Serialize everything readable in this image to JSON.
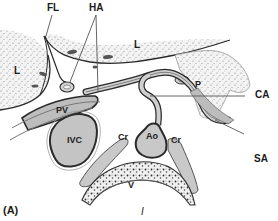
{
  "figure": {
    "panel_label": "(A)",
    "bottom_label": "I"
  },
  "labels": {
    "FL": "FL",
    "HA": "HA",
    "L_left": "L",
    "L_top": "L",
    "P": "P",
    "CA": "CA",
    "PV": "PV",
    "IVC": "IVC",
    "Cr_left": "Cr",
    "Ao": "Ao",
    "Cr_right": "Cr",
    "SA": "SA",
    "V": "V"
  },
  "colors": {
    "stipple_fill": "#e9e9e9",
    "vessel_fill": "#cfcfcf",
    "outline": "#2a2a2a",
    "leader_line": "#555555"
  }
}
